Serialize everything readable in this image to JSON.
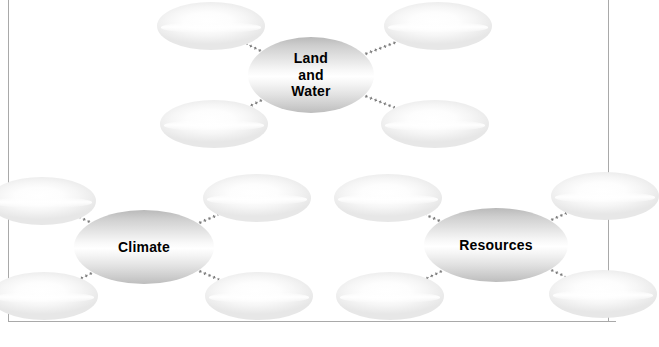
{
  "diagram": {
    "type": "concept-map",
    "frame": {
      "color": "#a9a9a9"
    },
    "connector": {
      "style": "dotted",
      "color": "#7a7a7a"
    },
    "clusters": [
      {
        "id": "land-and-water",
        "center": {
          "label": "Land\nand\nWater",
          "lines": [
            "Land",
            "and",
            "Water"
          ]
        },
        "satellites": [
          {
            "id": "land-water-top-left",
            "label": ""
          },
          {
            "id": "land-water-top-right",
            "label": ""
          },
          {
            "id": "land-water-bottom-left",
            "label": ""
          },
          {
            "id": "land-water-bottom-right",
            "label": ""
          }
        ]
      },
      {
        "id": "climate",
        "center": {
          "label": "Climate",
          "lines": [
            "Climate"
          ]
        },
        "satellites": [
          {
            "id": "climate-top-left",
            "label": ""
          },
          {
            "id": "climate-top-right",
            "label": ""
          },
          {
            "id": "climate-bottom-left",
            "label": ""
          },
          {
            "id": "climate-bottom-right",
            "label": ""
          }
        ]
      },
      {
        "id": "resources",
        "center": {
          "label": "Resources",
          "lines": [
            "Resources"
          ]
        },
        "satellites": [
          {
            "id": "resources-top-left",
            "label": ""
          },
          {
            "id": "resources-top-right",
            "label": ""
          },
          {
            "id": "resources-bottom-left",
            "label": ""
          },
          {
            "id": "resources-bottom-right",
            "label": ""
          }
        ]
      }
    ]
  }
}
